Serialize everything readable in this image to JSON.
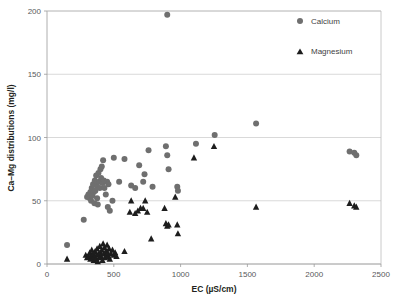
{
  "figure": {
    "title": "",
    "background_color": "#ffffff"
  },
  "axes": {
    "x_title": "EC (µS/cm)",
    "y_title": "Ca–Mg distributions (mg/l)",
    "x_ticks": [
      "0",
      "500",
      "1000",
      "1500",
      "2000",
      "2500"
    ],
    "y_ticks": [
      "0",
      "50",
      "100",
      "150",
      "200"
    ]
  },
  "legend": {
    "position": "top-right",
    "items": [
      {
        "label": "Calcium",
        "marker": "circle",
        "color": "#6f6f6f"
      },
      {
        "label": "Magnesium",
        "marker": "triangle",
        "color": "#1d1d1d"
      }
    ]
  },
  "chart_data": {
    "type": "scatter",
    "title": "",
    "xlabel": "EC (µS/cm)",
    "ylabel": "Ca–Mg distributions (mg/l)",
    "xlim": [
      0,
      2500
    ],
    "ylim": [
      0,
      200
    ],
    "xticks": [
      0,
      500,
      1000,
      1500,
      2000,
      2500
    ],
    "yticks": [
      0,
      50,
      100,
      150,
      200
    ],
    "grid": "horizontal",
    "legend_position": "top-right",
    "series": [
      {
        "name": "Calcium",
        "marker": "circle",
        "color": "#6f6f6f",
        "points": [
          [
            150,
            15
          ],
          [
            275,
            35
          ],
          [
            300,
            53
          ],
          [
            310,
            55
          ],
          [
            320,
            52
          ],
          [
            325,
            57
          ],
          [
            330,
            50
          ],
          [
            335,
            60
          ],
          [
            340,
            54
          ],
          [
            345,
            63
          ],
          [
            350,
            57
          ],
          [
            355,
            48
          ],
          [
            358,
            66
          ],
          [
            362,
            58
          ],
          [
            368,
            70
          ],
          [
            372,
            62
          ],
          [
            375,
            52
          ],
          [
            380,
            47
          ],
          [
            385,
            72
          ],
          [
            390,
            65
          ],
          [
            395,
            60
          ],
          [
            400,
            75
          ],
          [
            405,
            68
          ],
          [
            410,
            77
          ],
          [
            415,
            64
          ],
          [
            420,
            82
          ],
          [
            425,
            66
          ],
          [
            430,
            60
          ],
          [
            440,
            55
          ],
          [
            450,
            65
          ],
          [
            455,
            45
          ],
          [
            460,
            63
          ],
          [
            470,
            42
          ],
          [
            490,
            50
          ],
          [
            500,
            84
          ],
          [
            540,
            65
          ],
          [
            580,
            83
          ],
          [
            630,
            62
          ],
          [
            660,
            60
          ],
          [
            690,
            78
          ],
          [
            720,
            65
          ],
          [
            730,
            71
          ],
          [
            760,
            90
          ],
          [
            790,
            61
          ],
          [
            890,
            93
          ],
          [
            900,
            86
          ],
          [
            900,
            197
          ],
          [
            910,
            75
          ],
          [
            975,
            61
          ],
          [
            980,
            58
          ],
          [
            1115,
            95
          ],
          [
            1255,
            102
          ],
          [
            1565,
            111
          ],
          [
            2265,
            89
          ],
          [
            2300,
            88
          ],
          [
            2315,
            86
          ]
        ]
      },
      {
        "name": "Magnesium",
        "marker": "triangle",
        "color": "#1d1d1d",
        "points": [
          [
            150,
            4
          ],
          [
            290,
            7
          ],
          [
            300,
            5
          ],
          [
            310,
            6
          ],
          [
            320,
            9
          ],
          [
            325,
            4
          ],
          [
            330,
            7
          ],
          [
            335,
            11
          ],
          [
            340,
            5
          ],
          [
            345,
            8
          ],
          [
            350,
            3
          ],
          [
            355,
            6
          ],
          [
            360,
            10
          ],
          [
            365,
            4
          ],
          [
            370,
            7
          ],
          [
            375,
            12
          ],
          [
            380,
            2
          ],
          [
            385,
            8
          ],
          [
            390,
            5
          ],
          [
            395,
            14
          ],
          [
            400,
            9
          ],
          [
            405,
            6
          ],
          [
            410,
            11
          ],
          [
            415,
            3
          ],
          [
            420,
            16
          ],
          [
            425,
            8
          ],
          [
            430,
            13
          ],
          [
            435,
            5
          ],
          [
            440,
            10
          ],
          [
            445,
            7
          ],
          [
            450,
            15
          ],
          [
            455,
            9
          ],
          [
            460,
            6
          ],
          [
            465,
            12
          ],
          [
            470,
            4
          ],
          [
            480,
            8
          ],
          [
            490,
            11
          ],
          [
            500,
            7
          ],
          [
            510,
            9
          ],
          [
            520,
            6
          ],
          [
            580,
            10
          ],
          [
            620,
            41
          ],
          [
            630,
            50
          ],
          [
            660,
            40
          ],
          [
            680,
            42
          ],
          [
            700,
            44
          ],
          [
            720,
            44
          ],
          [
            735,
            50
          ],
          [
            750,
            41
          ],
          [
            780,
            20
          ],
          [
            880,
            44
          ],
          [
            890,
            32
          ],
          [
            900,
            30
          ],
          [
            910,
            31
          ],
          [
            975,
            31
          ],
          [
            980,
            24
          ],
          [
            960,
            53
          ],
          [
            1100,
            84
          ],
          [
            1250,
            93
          ],
          [
            1565,
            45
          ],
          [
            2265,
            48
          ],
          [
            2300,
            46
          ],
          [
            2315,
            45
          ]
        ]
      }
    ]
  }
}
